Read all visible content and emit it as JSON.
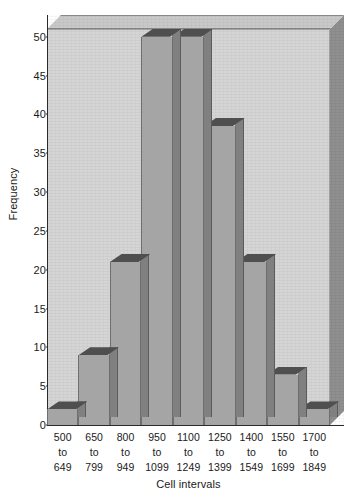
{
  "chart_data": {
    "type": "bar",
    "title": "",
    "xlabel": "Cell intervals",
    "ylabel": "Frequency",
    "categories": [
      "500 to 649",
      "650 to 799",
      "800 to 949",
      "950 to 1099",
      "1100 to 1249",
      "1250 to 1399",
      "1400 to 1549",
      "1550 to 1699",
      "1700 to 1849"
    ],
    "category_lines": [
      [
        "500",
        "to",
        "649"
      ],
      [
        "650",
        "to",
        "799"
      ],
      [
        "800",
        "to",
        "949"
      ],
      [
        "950",
        "to",
        "1099"
      ],
      [
        "1100",
        "to",
        "1249"
      ],
      [
        "1250",
        "to",
        "1399"
      ],
      [
        "1400",
        "to",
        "1549"
      ],
      [
        "1550",
        "to",
        "1699"
      ],
      [
        "1700",
        "to",
        "1849"
      ]
    ],
    "values": [
      2,
      9,
      21,
      50,
      50,
      38.5,
      21,
      6.5,
      2
    ],
    "ylim": [
      0,
      51
    ],
    "ytick_values": [
      0,
      5,
      10,
      15,
      20,
      25,
      30,
      35,
      40,
      45,
      50
    ],
    "ytick_labels": [
      "0",
      "5",
      "10",
      "15",
      "20",
      "25",
      "30",
      "35",
      "40",
      "45",
      "50"
    ],
    "grid": false,
    "legend": "none",
    "style": "3d-histogram",
    "colors": {
      "plot_background": "#d5d5d5",
      "bar_face": "#a5a5a5",
      "bar_side": "#808080",
      "bar_top": "#4f4f4f",
      "box_top": "#c9c9c9",
      "box_right": "#8f8f8f",
      "axis": "#2b2b2b",
      "text": "#1a1a1a",
      "page_background": "#ffffff"
    }
  }
}
